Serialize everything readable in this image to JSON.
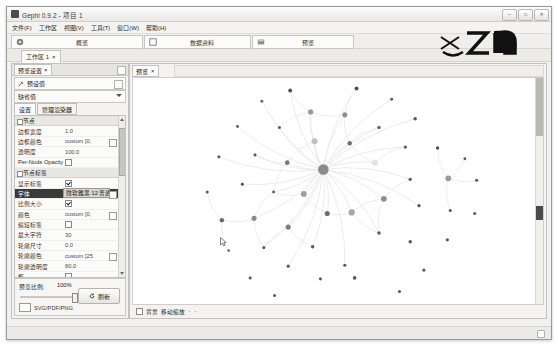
{
  "window": {
    "title": "Gephi 0.9.2 - 项目 1",
    "buttons": [
      {
        "name": "minimize",
        "glyph": "–"
      },
      {
        "name": "maximize",
        "glyph": "□"
      },
      {
        "name": "close",
        "glyph": "✕"
      }
    ]
  },
  "menubar": {
    "items": [
      {
        "label": "文件(F)"
      },
      {
        "label": "工作区"
      },
      {
        "label": "视图(V)"
      },
      {
        "label": "工具(T)"
      },
      {
        "label": "窗口(W)"
      },
      {
        "label": "帮助(H)"
      }
    ]
  },
  "toolbar": {
    "tabs": [
      {
        "label": "概览",
        "icon": "overview-icon",
        "active": false
      },
      {
        "label": "数据资料",
        "icon": "data-lab-icon",
        "active": false
      },
      {
        "label": "预览",
        "icon": "preview-icon",
        "active": true
      }
    ]
  },
  "workspace": {
    "tab_label": "工作区 1",
    "close_glyph": "×"
  },
  "left_panel": {
    "tab_label": "预览设置",
    "close_glyph": "×",
    "preset_label": "预设值",
    "preset_value": "缺省值",
    "subtabs": [
      {
        "label": "设置",
        "active": true
      },
      {
        "label": "管理渲染器",
        "active": false
      }
    ],
    "properties": [
      {
        "type": "group",
        "name": "节点",
        "value": ""
      },
      {
        "type": "text",
        "name": "边框宽度",
        "value": "1.0"
      },
      {
        "type": "color",
        "name": "边框颜色",
        "value": "custom [0,"
      },
      {
        "type": "text",
        "name": "透明度",
        "value": "100.0"
      },
      {
        "type": "check",
        "name": "Per-Node Opacity",
        "value": "",
        "checked": false
      },
      {
        "type": "group",
        "name": "节点标签",
        "value": ""
      },
      {
        "type": "check",
        "name": "显示标签",
        "value": "",
        "checked": true
      },
      {
        "type": "sel",
        "name": "字体",
        "value": "微软雅黑 12 普通"
      },
      {
        "type": "check",
        "name": "比例大小",
        "value": "",
        "checked": true
      },
      {
        "type": "color",
        "name": "颜色",
        "value": "custom [0,"
      },
      {
        "type": "check",
        "name": "缩短标签",
        "value": "",
        "checked": false
      },
      {
        "type": "text",
        "name": "最大字符",
        "value": "30"
      },
      {
        "type": "text",
        "name": "轮廓尺寸",
        "value": "0.0"
      },
      {
        "type": "color",
        "name": "轮廓颜色",
        "value": "custom [25"
      },
      {
        "type": "text",
        "name": "轮廓透明度",
        "value": "80.0"
      },
      {
        "type": "check",
        "name": "框",
        "value": "",
        "checked": false
      },
      {
        "type": "color",
        "name": "框的颜色",
        "value": "parent",
        "dim": true
      },
      {
        "type": "text",
        "name": "框透明",
        "value": "100.0",
        "dim": true
      },
      {
        "type": "group",
        "name": "边",
        "value": ""
      },
      {
        "type": "check",
        "name": "曲线边",
        "value": "",
        "checked": true
      }
    ],
    "ratio_label": "预览比例:",
    "ratio_value": "100%",
    "refresh_label": "刷新",
    "refresh_icon": "refresh-icon",
    "export_label": "SVG/PDF/PNG",
    "export_icon": "export-icon"
  },
  "center_panel": {
    "tab_label": "预览",
    "close_glyph": "×",
    "background_checkbox_label": "背景",
    "background_checked": false,
    "pan_zoom_label": "移动缩放",
    "dots": "· ·"
  },
  "graph": {
    "node_color_small": "#4a4a4a",
    "node_color_mid": "#8e8e8e",
    "node_color_hub": "#8a8a8a",
    "edge_color": "#e9e9e9",
    "nodes": [
      {
        "x": 291,
        "y": 82,
        "r": 2.0,
        "c": "#4f4f4f"
      },
      {
        "x": 359,
        "y": 80,
        "r": 2.0,
        "c": "#4f4f4f"
      },
      {
        "x": 262,
        "y": 93,
        "r": 1.5,
        "c": "#6a6a6a"
      },
      {
        "x": 395,
        "y": 91,
        "r": 1.5,
        "c": "#5b5b5b"
      },
      {
        "x": 312,
        "y": 104,
        "r": 2.7,
        "c": "#9b9b9b"
      },
      {
        "x": 347,
        "y": 107,
        "r": 2.6,
        "c": "#8f8f8f"
      },
      {
        "x": 419,
        "y": 111,
        "r": 1.8,
        "c": "#5a5a5a"
      },
      {
        "x": 237,
        "y": 119,
        "r": 1.5,
        "c": "#5e5e5e"
      },
      {
        "x": 280,
        "y": 120,
        "r": 1.6,
        "c": "#5c5c5c"
      },
      {
        "x": 382,
        "y": 120,
        "r": 1.8,
        "c": "#6a6a6a"
      },
      {
        "x": 316,
        "y": 134,
        "r": 3.1,
        "c": "#c2c2c2"
      },
      {
        "x": 352,
        "y": 136,
        "r": 2.3,
        "c": "#6f6f6f"
      },
      {
        "x": 409,
        "y": 140,
        "r": 1.7,
        "c": "#5c5c5c"
      },
      {
        "x": 442,
        "y": 141,
        "r": 1.8,
        "c": "#555"
      },
      {
        "x": 255,
        "y": 148,
        "r": 1.6,
        "c": "#5b5b5b"
      },
      {
        "x": 218,
        "y": 150,
        "r": 1.6,
        "c": "#5f5f5f"
      },
      {
        "x": 288,
        "y": 156,
        "r": 2.4,
        "c": "#7a7a7a"
      },
      {
        "x": 378,
        "y": 156,
        "r": 3.0,
        "c": "#e2e2e2"
      },
      {
        "x": 325,
        "y": 163,
        "r": 5.4,
        "c": "#8a8a8a"
      },
      {
        "x": 414,
        "y": 173,
        "r": 1.7,
        "c": "#5c5c5c"
      },
      {
        "x": 453,
        "y": 172,
        "r": 3.0,
        "c": "#9a9a9a"
      },
      {
        "x": 206,
        "y": 186,
        "r": 1.6,
        "c": "#5e5e5e"
      },
      {
        "x": 242,
        "y": 178,
        "r": 1.6,
        "c": "#565656"
      },
      {
        "x": 274,
        "y": 186,
        "r": 1.5,
        "c": "#5e5e5e"
      },
      {
        "x": 482,
        "y": 174,
        "r": 1.6,
        "c": "#5a5a5a"
      },
      {
        "x": 305,
        "y": 188,
        "r": 3.0,
        "c": "#9d9d9d"
      },
      {
        "x": 387,
        "y": 193,
        "r": 3.0,
        "c": "#8f8f8f"
      },
      {
        "x": 423,
        "y": 200,
        "r": 1.7,
        "c": "#545454"
      },
      {
        "x": 455,
        "y": 205,
        "r": 1.6,
        "c": "#5c5c5c"
      },
      {
        "x": 329,
        "y": 208,
        "r": 2.6,
        "c": "#6f6f6f"
      },
      {
        "x": 354,
        "y": 207,
        "r": 3.2,
        "c": "#a8a8a8"
      },
      {
        "x": 221,
        "y": 215,
        "r": 2.3,
        "c": "#6b6b6b"
      },
      {
        "x": 254,
        "y": 213,
        "r": 2.6,
        "c": "#8a8a8a"
      },
      {
        "x": 289,
        "y": 222,
        "r": 2.6,
        "c": "#7c7c7c"
      },
      {
        "x": 382,
        "y": 228,
        "r": 1.8,
        "c": "#5a5a5a"
      },
      {
        "x": 414,
        "y": 237,
        "r": 1.8,
        "c": "#5b5b5b"
      },
      {
        "x": 452,
        "y": 235,
        "r": 1.7,
        "c": "#5c5c5c"
      },
      {
        "x": 228,
        "y": 246,
        "r": 1.4,
        "c": "#6e6e6e"
      },
      {
        "x": 264,
        "y": 243,
        "r": 1.6,
        "c": "#5d5d5d"
      },
      {
        "x": 314,
        "y": 242,
        "r": 1.8,
        "c": "#5a5a5a"
      },
      {
        "x": 289,
        "y": 262,
        "r": 1.7,
        "c": "#5d5d5d"
      },
      {
        "x": 347,
        "y": 261,
        "r": 1.6,
        "c": "#5b5b5b"
      },
      {
        "x": 428,
        "y": 266,
        "r": 1.7,
        "c": "#5c5c5c"
      },
      {
        "x": 250,
        "y": 274,
        "r": 1.6,
        "c": "#5e5e5e"
      },
      {
        "x": 322,
        "y": 275,
        "r": 1.6,
        "c": "#5b5b5b"
      },
      {
        "x": 357,
        "y": 274,
        "r": 1.8,
        "c": "#555"
      },
      {
        "x": 403,
        "y": 288,
        "r": 1.6,
        "c": "#5b5b5b"
      },
      {
        "x": 275,
        "y": 292,
        "r": 1.6,
        "c": "#5e5e5e"
      },
      {
        "x": 370,
        "y": 303,
        "r": 1.5,
        "c": "#606060"
      },
      {
        "x": 480,
        "y": 208,
        "r": 1.6,
        "c": "#5d5d5d"
      },
      {
        "x": 470,
        "y": 152,
        "r": 1.5,
        "c": "#606060"
      }
    ],
    "cursor": {
      "x": 219,
      "y": 232
    }
  }
}
